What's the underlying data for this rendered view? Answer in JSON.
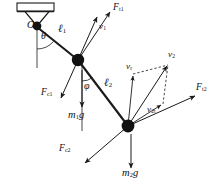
{
  "figure": {
    "type": "free-body-diagram",
    "background_color": "#ffffff",
    "stroke_color": "#1a1a1a",
    "node_fill": "#111111"
  },
  "support": {
    "name": "ceiling-bracket",
    "hatch_label": ""
  },
  "pivot": {
    "label": "O",
    "x": 37,
    "y": 27
  },
  "nodes": [
    {
      "name": "mass-1",
      "label": "",
      "x": 78,
      "y": 60,
      "radius": 6.2
    },
    {
      "name": "mass-2",
      "label": "",
      "x": 128,
      "y": 126,
      "radius": 6.4
    }
  ],
  "rods": [
    {
      "name": "rod-l1",
      "label": "ℓ",
      "sub": "1",
      "label_x": 58,
      "label_y": 28
    },
    {
      "name": "rod-l2",
      "label": "ℓ",
      "sub": "2",
      "label_x": 104,
      "label_y": 82
    }
  ],
  "angles": [
    {
      "name": "angle-theta",
      "label": "θ",
      "x": 41,
      "y": 36
    },
    {
      "name": "angle-phi",
      "label": "φ",
      "x": 84,
      "y": 86
    }
  ],
  "vectors": [
    {
      "name": "tension-1",
      "label": "F",
      "sub": "t1",
      "label_x": 113,
      "label_y": 5,
      "from": [
        78,
        60
      ],
      "to": [
        110,
        12
      ]
    },
    {
      "name": "velocity-1",
      "label": "v",
      "sub": "1",
      "label_x": 99,
      "label_y": 25,
      "from": [
        78,
        60
      ],
      "to": [
        97,
        17
      ]
    },
    {
      "name": "centripetal-1",
      "label": "F",
      "sub": "c1",
      "label_x": 42,
      "label_y": 92,
      "from": [
        78,
        60
      ],
      "to": [
        60,
        99
      ]
    },
    {
      "name": "weight-1",
      "label": "m",
      "sub": "1",
      "label_tail": "g",
      "label_x": 69,
      "label_y": 114,
      "from": [
        82,
        69
      ],
      "to": [
        82,
        109
      ]
    },
    {
      "name": "tension-2",
      "label": "F",
      "sub": "t2",
      "label_x": 197,
      "label_y": 86,
      "from": [
        128,
        126
      ],
      "to": [
        196,
        96
      ]
    },
    {
      "name": "velocity-2",
      "label": "v",
      "sub": "2",
      "label_x": 169,
      "label_y": 53,
      "from": [
        128,
        126
      ],
      "to": [
        168,
        65
      ]
    },
    {
      "name": "velocity-radial",
      "label": "v",
      "sub": "r",
      "label_x": 127,
      "label_y": 65,
      "from": [
        128,
        126
      ],
      "to": [
        133,
        74
      ]
    },
    {
      "name": "velocity-tangential",
      "label": "v",
      "sub": "2t",
      "label_x": 148,
      "label_y": 108,
      "from": [
        128,
        126
      ],
      "to": [
        163,
        104
      ]
    },
    {
      "name": "centripetal-2",
      "label": "F",
      "sub": "c2",
      "label_x": 60,
      "label_y": 148,
      "from": [
        128,
        126
      ],
      "to": [
        84,
        164
      ]
    },
    {
      "name": "weight-2",
      "label": "m",
      "sub": "2",
      "label_tail": "g",
      "label_x": 123,
      "label_y": 172,
      "from": [
        131,
        134
      ],
      "to": [
        131,
        170
      ]
    }
  ],
  "construction_lines": [
    {
      "name": "vertical-reference-pivot",
      "style": "solid"
    },
    {
      "name": "vertical-reference-mass1",
      "style": "solid"
    },
    {
      "name": "parallelogram-dashed-1",
      "style": "dashed"
    },
    {
      "name": "parallelogram-dashed-2",
      "style": "dashed"
    }
  ]
}
